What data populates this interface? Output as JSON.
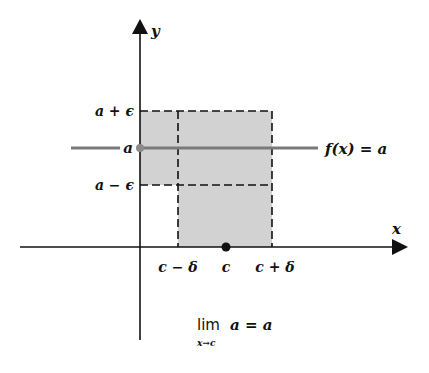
{
  "diagram": {
    "axes": {
      "x_label": "x",
      "y_label": "y"
    },
    "y_ticks": {
      "upper": "a + ϵ",
      "middle": "a",
      "lower": "a − ϵ"
    },
    "x_ticks": {
      "left": "c − δ",
      "middle": "c",
      "right": "c + δ"
    },
    "function_label": "f(x) = a",
    "formula": {
      "lim": "lim",
      "subscript": "x→c",
      "expression": "a = a"
    },
    "colors": {
      "shading": "#d2d2d2",
      "function_line": "#7a7a7a",
      "axes": "#111111",
      "point": "#111111",
      "y_point": "#8a8a8a"
    }
  }
}
